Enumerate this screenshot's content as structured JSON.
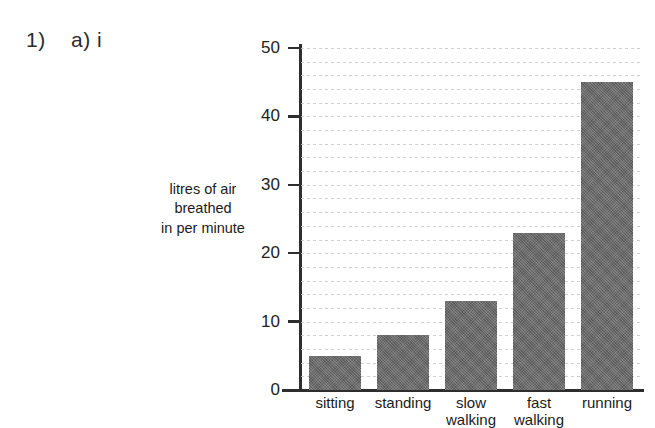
{
  "question_label": "1)    a) i",
  "chart_data": {
    "type": "bar",
    "title": "",
    "xlabel": "",
    "ylabel": "litres of air\nbreathed\nin per minute",
    "ylabel_lines": [
      "litres of air",
      "breathed",
      "in per minute"
    ],
    "categories": [
      "sitting",
      "standing",
      "slow walking",
      "fast walking",
      "running"
    ],
    "category_lines": [
      [
        "sitting",
        ""
      ],
      [
        "standing",
        ""
      ],
      [
        "slow",
        "walking"
      ],
      [
        "fast",
        "walking"
      ],
      [
        "running",
        ""
      ]
    ],
    "values": [
      5,
      8,
      13,
      23,
      45
    ],
    "ylim": [
      0,
      50
    ],
    "yticks": [
      0,
      10,
      20,
      30,
      40,
      50
    ],
    "ytick_labels": [
      "0",
      "10",
      "20",
      "30",
      "40",
      "50"
    ],
    "grid": true,
    "grid_axis": "y",
    "grid_style": "dashed",
    "grid_step": 2,
    "legend": false,
    "bar_color": "#686868",
    "axis_color": "#2e2e2e",
    "grid_color": "#c9c9c9",
    "background_color": "#ffffff"
  }
}
